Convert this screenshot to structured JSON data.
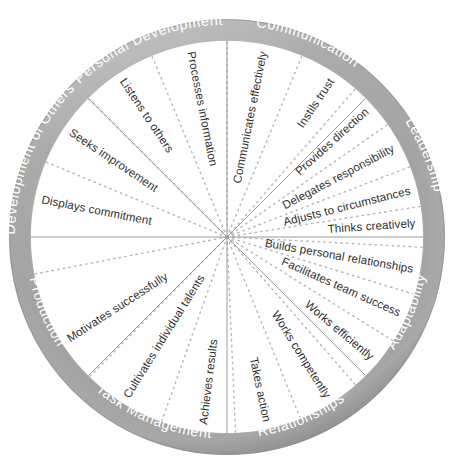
{
  "diagram": {
    "type": "radial-segmented-wheel",
    "colors": {
      "outer_ring": "#a9a9a9",
      "outer_ring_shadow": "#8f8f8f",
      "outer_ring_highlight": "#c4c4c4",
      "ring_text": "#ffffff",
      "inner_background": "#ffffff",
      "sector_divider": "#9a9a9a",
      "spoke_divider_dotted": "#b5b5b5",
      "spoke_text": "#2f2f2f"
    },
    "geometry": {
      "center_x": 227,
      "center_y": 237,
      "outer_radius": 218,
      "ring_inner_radius": 196,
      "sector_count": 8,
      "spoke_count": 20
    }
  },
  "sectors": [
    {
      "id": "communication",
      "label": "Communication",
      "start_angle": -90,
      "end_angle": -45,
      "competencies": [
        "Communicates effectively",
        "Processes information",
        "Listens to others"
      ]
    },
    {
      "id": "leadership",
      "label": "Leadership",
      "start_angle": -90,
      "end_angle": -45,
      "competencies": [
        "Instils trust",
        "Provides direction",
        "Delegates responsibility"
      ]
    },
    {
      "id": "adaptability",
      "label": "Adaptability",
      "start_angle": -45,
      "end_angle": 0,
      "competencies": [
        "Adjusts to circumstances",
        "Thinks creatively"
      ]
    },
    {
      "id": "relationships",
      "label": "Relationships",
      "start_angle": 0,
      "end_angle": 45,
      "competencies": [
        "Builds personal relationships",
        "Facilitates team success"
      ]
    },
    {
      "id": "task-management",
      "label": "Task Management",
      "start_angle": 45,
      "end_angle": 90,
      "competencies": [
        "Works efficiently",
        "Works competently"
      ]
    },
    {
      "id": "production",
      "label": "Production",
      "start_angle": 90,
      "end_angle": 135,
      "competencies": [
        "Takes action",
        "Achieves results",
        "Cultivates individual talents"
      ]
    },
    {
      "id": "development-of-others",
      "label": "Development of Others",
      "start_angle": 135,
      "end_angle": 180,
      "competencies": [
        "Motivates successfully",
        "Cultivates individual talents"
      ]
    },
    {
      "id": "personal-development",
      "label": "Personal Development",
      "start_angle": 180,
      "end_angle": 225,
      "competencies": [
        "Displays commitment",
        "Seeks improvement"
      ]
    }
  ],
  "ring_labels": [
    {
      "id": "communication",
      "text": "Communication",
      "mid_angle": -67.5
    },
    {
      "id": "leadership",
      "text": "Leadership",
      "mid_angle": -22.5
    },
    {
      "id": "adaptability",
      "text": "Adaptability",
      "mid_angle": 22.5
    },
    {
      "id": "relationships",
      "text": "Relationships",
      "mid_angle": 67.5
    },
    {
      "id": "task-management",
      "text": "Task Management",
      "mid_angle": 112.5
    },
    {
      "id": "production",
      "text": "Production",
      "mid_angle": 157.5
    },
    {
      "id": "development-of-others",
      "text": "Development of Others",
      "mid_angle": 202.5
    },
    {
      "id": "personal-development",
      "text": "Personal Development",
      "mid_angle": 247.5
    }
  ],
  "spokes": [
    {
      "id": "communicates-effectively",
      "text": "Communicates effectively",
      "angle": -78.75,
      "sector": "communication"
    },
    {
      "id": "processes-information",
      "text": "Processes information",
      "angle": -101.25,
      "sector": "communication"
    },
    {
      "id": "listens-to-others",
      "text": "Listens to others",
      "angle": -123.75,
      "sector": "communication"
    },
    {
      "id": "seeks-improvement",
      "text": "Seeks improvement",
      "angle": -146.25,
      "sector": "personal-development"
    },
    {
      "id": "displays-commitment",
      "text": "Displays commitment",
      "angle": -168.75,
      "sector": "personal-development"
    },
    {
      "id": "instils-trust",
      "text": "Instils trust",
      "angle": -56.25,
      "sector": "leadership"
    },
    {
      "id": "provides-direction",
      "text": "Provides direction",
      "angle": -42.0,
      "sector": "leadership"
    },
    {
      "id": "delegates-responsibility",
      "text": "Delegates responsibility",
      "angle": -28.0,
      "sector": "leadership"
    },
    {
      "id": "adjusts-to-circumstances",
      "text": "Adjusts to circumstances",
      "angle": -14.0,
      "sector": "adaptability"
    },
    {
      "id": "thinks-creatively",
      "text": "Thinks creatively",
      "angle": -4.0,
      "sector": "adaptability"
    },
    {
      "id": "builds-personal-relationships",
      "text": "Builds personal relationships",
      "angle": 10.0,
      "sector": "relationships"
    },
    {
      "id": "facilitates-team-success",
      "text": "Facilitates team success",
      "angle": 24.0,
      "sector": "relationships"
    },
    {
      "id": "works-efficiently",
      "text": "Works efficiently",
      "angle": 40.0,
      "sector": "task-management"
    },
    {
      "id": "works-competently",
      "text": "Works competently",
      "angle": 58.0,
      "sector": "task-management"
    },
    {
      "id": "takes-action",
      "text": "Takes action",
      "angle": 78.0,
      "sector": "production"
    },
    {
      "id": "achieves-results",
      "text": "Achieves results",
      "angle": 97.0,
      "sector": "production"
    },
    {
      "id": "cultivates-individual-talents",
      "text": "Cultivates individual talents",
      "angle": 122.0,
      "sector": "development-of-others"
    },
    {
      "id": "motivates-successfully",
      "text": "Motivates successfully",
      "angle": 147.0,
      "sector": "development-of-others"
    }
  ]
}
